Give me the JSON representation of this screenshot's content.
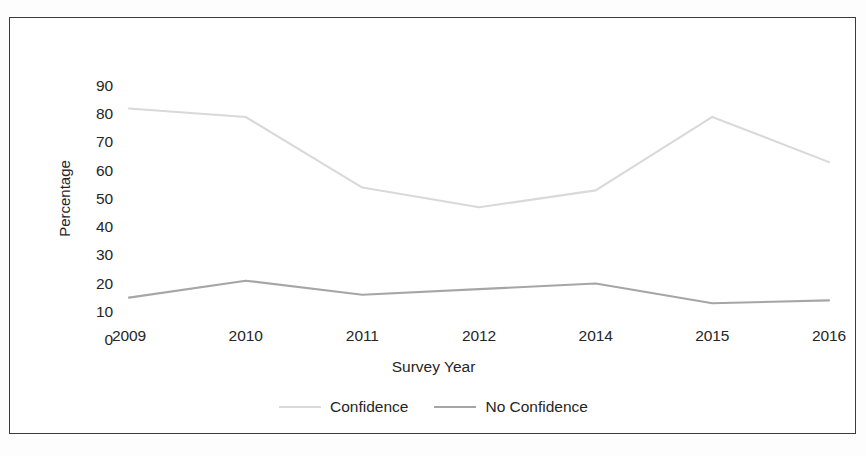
{
  "chart_data": {
    "type": "line",
    "title": "",
    "xlabel": "Survey Year",
    "ylabel": "Percentage",
    "categories": [
      "2009",
      "2010",
      "2011",
      "2012",
      "2014",
      "2015",
      "2016"
    ],
    "ylim": [
      0,
      90
    ],
    "ytick_step": 10,
    "yticks": [
      90,
      80,
      70,
      60,
      50,
      40,
      30,
      20,
      10,
      0
    ],
    "grid": false,
    "legend_position": "bottom-center",
    "series": [
      {
        "name": "Confidence",
        "color": "#d9d9d9",
        "values": [
          76,
          73,
          48,
          41,
          47,
          73,
          57
        ]
      },
      {
        "name": "No Confidence",
        "color": "#a6a6a6",
        "values": [
          9,
          15,
          10,
          12,
          14,
          7,
          8
        ]
      }
    ]
  },
  "frame": {
    "border_color": "#3b3b3b",
    "background": "#ffffff"
  }
}
